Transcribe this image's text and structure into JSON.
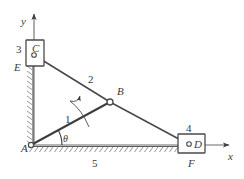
{
  "diagram": {
    "colors": {
      "line": "#5a5a5a",
      "line_dark": "#3d3d3d",
      "text": "#3a3a3a",
      "hatch": "#8a8a8a",
      "background": "#ffffff",
      "joint_fill": "#ffffff"
    },
    "axes": {
      "x_label": "x",
      "y_label": "y",
      "origin_label": "A"
    },
    "joints": [
      {
        "id": "A",
        "label": "A",
        "x": 31,
        "y": 145,
        "type": "ground-pivot"
      },
      {
        "id": "B",
        "label": "B",
        "x": 110,
        "y": 102,
        "type": "pin-joint"
      },
      {
        "id": "C",
        "label": "C",
        "x": 34,
        "y": 55,
        "type": "pin-in-slider"
      },
      {
        "id": "D",
        "label": "D",
        "x": 190,
        "y": 145,
        "type": "pin-in-slider"
      }
    ],
    "sliders": [
      {
        "id": "C",
        "label": "C",
        "number": "3",
        "guide_label": "E",
        "orientation": "vertical"
      },
      {
        "id": "D",
        "label": "D",
        "number": "4",
        "guide_label": "F",
        "orientation": "horizontal"
      }
    ],
    "links": [
      {
        "number": "1",
        "from": "A",
        "to": "B",
        "name": "crank"
      },
      {
        "number": "2",
        "from": "C",
        "to": "B",
        "name": "upper-link"
      },
      {
        "number": "3",
        "from": "B",
        "to": "D",
        "name": "lower-link"
      },
      {
        "number": "5",
        "from": "A",
        "to": "F",
        "name": "ground-frame"
      }
    ],
    "link_numbers": {
      "crank": "1",
      "upper_link": "2",
      "slider_c": "3",
      "slider_d": "4",
      "frame": "5"
    },
    "angle": {
      "symbol": "θ",
      "at": "A",
      "between": "link-1-and-x-axis"
    },
    "rotation_arrow": {
      "name": "crank-rotation-arrow",
      "direction": "counterclockwise"
    }
  }
}
